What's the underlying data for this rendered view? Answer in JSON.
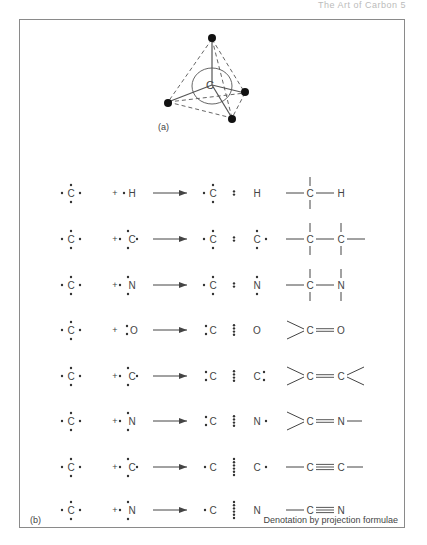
{
  "running_head": "The Art of Carbon    5",
  "panel_a": {
    "label": "(a)",
    "center_atom": "C"
  },
  "panel_b": {
    "label": "(b)",
    "footer": "Denotation by projection formulae",
    "rows": [
      {
        "left": "C",
        "partner": "H",
        "product": "C : H",
        "structural": "—C—H (single bond, tetravalent)"
      },
      {
        "left": "C",
        "partner": "C",
        "product": "C : C",
        "structural": "—C—C— (single bond)"
      },
      {
        "left": "C",
        "partner": "N",
        "product": "C : N",
        "structural": "—C—N (single bond)"
      },
      {
        "left": "C",
        "partner": "O",
        "product": "C :: O",
        "structural": ">C=O (double bond)"
      },
      {
        "left": "C",
        "partner": "C",
        "product": "C :: C",
        "structural": ">C=C< (double bond)"
      },
      {
        "left": "C",
        "partner": "N",
        "product": "C :: N",
        "structural": ">C=N— (double bond)"
      },
      {
        "left": "C",
        "partner": "C",
        "product": "C ::: C",
        "structural": "—C≡C— (triple bond)"
      },
      {
        "left": "C",
        "partner": "N",
        "product": "C ::: N",
        "structural": "—C≡N (triple bond)"
      }
    ],
    "plus_sign": "+"
  }
}
